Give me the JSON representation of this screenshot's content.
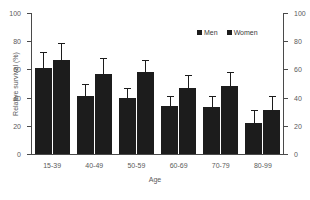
{
  "chart_data": {
    "type": "bar",
    "title": "",
    "xlabel": "Age",
    "ylabel": "Relative survival (%)",
    "ylim": [
      0,
      100
    ],
    "yticks": [
      0,
      20,
      40,
      60,
      80,
      100
    ],
    "y_right_ticks": [
      0,
      20,
      40,
      60,
      80,
      100
    ],
    "grid": false,
    "legend_position": "top-right",
    "categories": [
      "15-39",
      "40-49",
      "50-59",
      "60-69",
      "70-79",
      "80-99"
    ],
    "series": [
      {
        "name": "Men",
        "color": "#1c1c1c",
        "values": [
          61,
          41,
          40,
          34,
          33,
          22
        ],
        "err_low": [
          49,
          32,
          33,
          28,
          26,
          14
        ],
        "err_high": [
          72,
          50,
          47,
          41,
          41,
          31
        ]
      },
      {
        "name": "Women",
        "color": "#1c1c1c",
        "values": [
          67,
          57,
          58,
          47,
          48,
          31
        ],
        "err_low": [
          56,
          45,
          48,
          39,
          39,
          22
        ],
        "err_high": [
          79,
          68,
          67,
          56,
          58,
          41
        ]
      }
    ]
  },
  "legend": {
    "entries": [
      {
        "label": "Men"
      },
      {
        "label": "Women"
      }
    ]
  },
  "axes": {
    "y_left_title": "Relative survival (%)",
    "x_title": "Age"
  }
}
